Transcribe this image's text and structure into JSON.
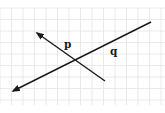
{
  "figure": {
    "type": "intersecting-lines-on-grid",
    "background": "#ffffff",
    "grid": {
      "x_start": 0,
      "x_end": 165,
      "y_start": 8,
      "y_end": 105,
      "spacing": 11.5,
      "color": "#e4e4e4"
    },
    "lines": [
      {
        "label": "p",
        "from": [
          105,
          81
        ],
        "to": [
          37,
          33
        ],
        "arrow_at": "to",
        "label_pos": [
          64,
          48
        ]
      },
      {
        "label": "q",
        "from": [
          151,
          22
        ],
        "to": [
          13,
          91
        ],
        "arrow_at": "to",
        "label_pos": [
          110,
          55
        ]
      }
    ],
    "intersection": [
      75,
      60
    ],
    "line_color": "#1a1a1a"
  }
}
